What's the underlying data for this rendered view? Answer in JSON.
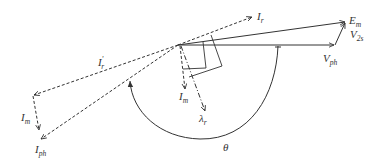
{
  "diagram": {
    "type": "phasor-diagram",
    "origin": {
      "x": 178,
      "y": 45
    },
    "colors": {
      "stroke": "#333333",
      "background": "#ffffff"
    },
    "labels": {
      "Em": {
        "main": "E",
        "sub": "m"
      },
      "V2s": {
        "main": "V",
        "sub": "2s"
      },
      "Vph": {
        "main": "V",
        "sub": "ph"
      },
      "Ir": {
        "main": "I",
        "sub": "r"
      },
      "Ir_prime": {
        "main": "I",
        "sub": "r",
        "sup": "'"
      },
      "Im_left": {
        "main": "I",
        "sub": "m"
      },
      "Iph": {
        "main": "I",
        "sub": "ph"
      },
      "Im_center": {
        "main": "I",
        "sub": "m"
      },
      "lambda_r": {
        "main": "λ",
        "sub": "r"
      },
      "theta": {
        "main": "θ"
      }
    },
    "phasors": [
      {
        "name": "E_m",
        "style": "solid",
        "from": [
          178,
          45
        ],
        "to": [
          346,
          22
        ]
      },
      {
        "name": "V_ph",
        "style": "solid",
        "from": [
          178,
          45
        ],
        "to": [
          335,
          45
        ]
      },
      {
        "name": "V_2s",
        "style": "solid",
        "from": [
          335,
          45
        ],
        "to": [
          346,
          22
        ]
      },
      {
        "name": "I_r",
        "style": "dashed",
        "from": [
          178,
          45
        ],
        "to": [
          253,
          17
        ]
      },
      {
        "name": "I_r'",
        "style": "dashed",
        "from": [
          178,
          45
        ],
        "to": [
          33,
          95
        ]
      },
      {
        "name": "I_m (left)",
        "style": "dashed",
        "from": [
          33,
          95
        ],
        "to": [
          39,
          130
        ]
      },
      {
        "name": "I_ph",
        "style": "dashed",
        "from": [
          178,
          45
        ],
        "to": [
          40,
          140
        ]
      },
      {
        "name": "I_m (center)",
        "style": "dashed",
        "from": [
          180,
          45
        ],
        "to": [
          185,
          89
        ]
      },
      {
        "name": "λ_r",
        "style": "dash-dot",
        "from": [
          180,
          45
        ],
        "to": [
          205,
          112
        ]
      }
    ],
    "angle": {
      "name": "θ",
      "style": "solid-arc"
    }
  }
}
